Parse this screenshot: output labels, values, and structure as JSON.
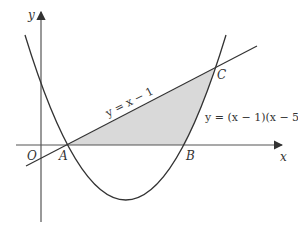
{
  "diagram": {
    "axes": {
      "x_label": "x",
      "y_label": "y",
      "origin_label": "O"
    },
    "curves": {
      "line_label": "y = x − 1",
      "parabola_label": "y = (x − 1)(x − 5)"
    },
    "points": {
      "A": "A",
      "B": "B",
      "C": "C"
    },
    "colors": {
      "stroke": "#333333",
      "shade": "#d9d9d9",
      "axis": "#555555"
    }
  }
}
